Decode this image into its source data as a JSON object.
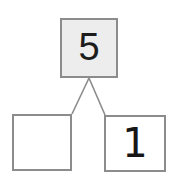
{
  "diagram": {
    "type": "number-bond",
    "background_color": "#ffffff",
    "whole": {
      "label": "5",
      "fill_color": "#ededed",
      "border_color": "#8c8c8c",
      "text_color": "#1c1c1c"
    },
    "parts": [
      {
        "position": "left",
        "label": "",
        "state": "blank",
        "fill_color": "#ffffff",
        "border_color": "#8c8c8c"
      },
      {
        "position": "right",
        "label": "1",
        "state": "filled",
        "fill_color": "#ffffff",
        "border_color": "#8c8c8c",
        "text_color": "#161616"
      }
    ],
    "connectors": [
      {
        "name": "whole-to-left-part",
        "from": [
          89,
          78
        ],
        "to": [
          72,
          114
        ],
        "color": "#8c8c8c"
      },
      {
        "name": "whole-to-right-part",
        "from": [
          89,
          78
        ],
        "to": [
          105,
          115
        ],
        "color": "#8c8c8c"
      }
    ]
  }
}
